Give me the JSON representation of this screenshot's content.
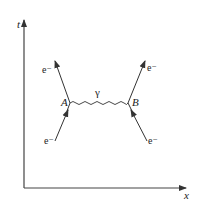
{
  "diagram": {
    "type": "feynman-diagram",
    "axes": {
      "vertical_label": "t",
      "horizontal_label": "x"
    },
    "vertices": [
      {
        "id": "A",
        "label": "A"
      },
      {
        "id": "B",
        "label": "B"
      }
    ],
    "propagator": {
      "label": "γ",
      "from": "A",
      "to": "B",
      "style": "wavy"
    },
    "particles": [
      {
        "name": "incoming-electron-left",
        "label": "e⁻",
        "to": "A",
        "direction": "in"
      },
      {
        "name": "outgoing-electron-left",
        "label": "e⁻",
        "from": "A",
        "direction": "out"
      },
      {
        "name": "incoming-electron-right",
        "label": "e⁻",
        "to": "B",
        "direction": "in"
      },
      {
        "name": "outgoing-electron-right",
        "label": "e⁻",
        "from": "B",
        "direction": "out"
      }
    ],
    "colors": {
      "line": "#333333",
      "background": "#ffffff"
    }
  }
}
